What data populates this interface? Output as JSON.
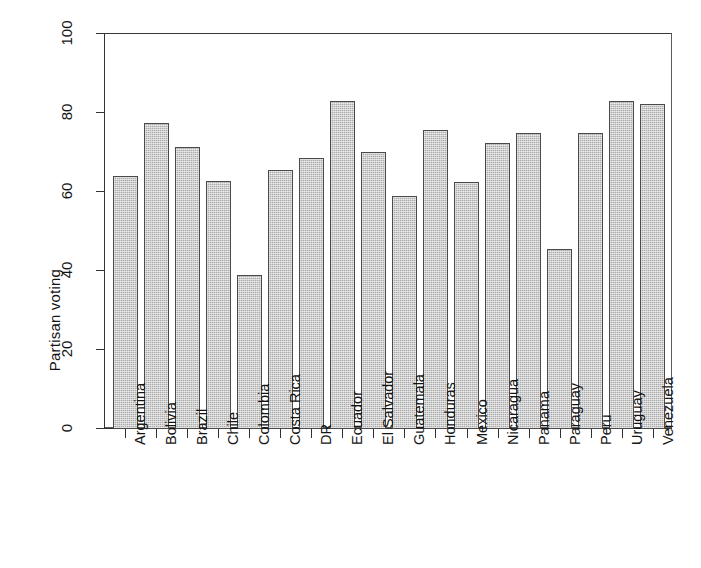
{
  "chart_data": {
    "type": "bar",
    "title": "",
    "subtitle": "",
    "xlabel": "",
    "ylabel": "Partisan voting",
    "ylim": [
      0,
      100
    ],
    "yticks": [
      0,
      20,
      40,
      60,
      80,
      100
    ],
    "ytick_labels": [
      "0",
      "20",
      "40",
      "60",
      "80",
      "100"
    ],
    "grid": false,
    "legend": false,
    "legend_position": "none",
    "bar_fill_color": "#ababab",
    "bar_border_color": "#4a4a4a",
    "axis_color": "#333333",
    "background_color": "#ffffff",
    "categories": [
      "Argentina",
      "Bolivia",
      "Brazil",
      "Chile",
      "Colombia",
      "Costa Rica",
      "DR",
      "Ecuador",
      "El Salvador",
      "Guatemala",
      "Honduras",
      "Mexico",
      "Nicaragua",
      "Panama",
      "Paraguay",
      "Peru",
      "Uruguay",
      "Venezuela"
    ],
    "values": [
      63.8,
      77.3,
      71.2,
      62.5,
      38.8,
      65.4,
      68.4,
      82.7,
      70.0,
      58.8,
      75.4,
      62.2,
      72.1,
      74.6,
      45.3,
      74.8,
      82.8,
      81.9
    ]
  },
  "axes": {
    "y_title": "Partisan voting"
  }
}
